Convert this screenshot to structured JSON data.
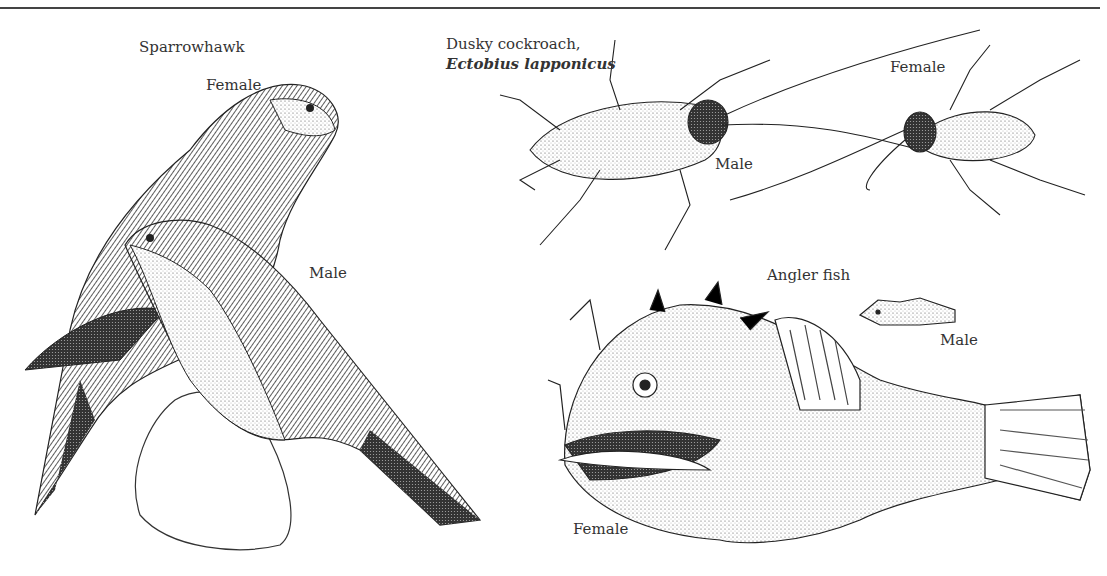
{
  "figure": {
    "panels": [
      {
        "id": "sparrowhawk",
        "title": "Sparrowhawk",
        "labels": {
          "female": "Female",
          "male": "Male"
        }
      },
      {
        "id": "cockroach",
        "title": "Dusky cockroach,",
        "species": "Ectobius lapponicus",
        "labels": {
          "female": "Female",
          "male": "Male"
        }
      },
      {
        "id": "angler",
        "title": "Angler fish",
        "labels": {
          "male": "Male",
          "female": "Female"
        }
      }
    ]
  }
}
